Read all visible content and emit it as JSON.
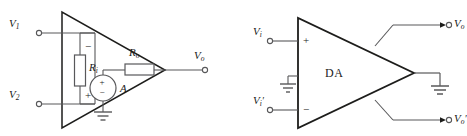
{
  "figure": {
    "stroke_color": "#58585a",
    "bold_stroke_color": "#1d1d1b",
    "text_color": "#1a1a1a",
    "background": "#ffffff"
  },
  "left_circuit": {
    "name": "op-amp-equivalent-model",
    "input1": {
      "label_v": "V",
      "label_sub": "1"
    },
    "input2": {
      "label_v": "V",
      "label_sub": "2"
    },
    "input_resistor": {
      "label_v": "R",
      "label_sub": "i"
    },
    "output_resistor": {
      "label_v": "R",
      "label_sub": "o"
    },
    "source_gain": "A",
    "source_plus": "+",
    "source_minus": "−",
    "ri_minus": "−",
    "ri_plus": "+",
    "output": {
      "label_v": "V",
      "label_sub": "o"
    },
    "ground": "ground-symbol"
  },
  "right_circuit": {
    "name": "differential-amplifier-block",
    "block_label": "DA",
    "input_top": {
      "label_v": "V",
      "label_sub": "i",
      "prime": ""
    },
    "input_bottom": {
      "label_v": "V",
      "label_sub": "i",
      "prime": "′"
    },
    "terminal_plus": "+",
    "terminal_minus": "−",
    "output_top": {
      "label_v": "V",
      "label_sub": "o",
      "prime": ""
    },
    "output_bottom": {
      "label_v": "V",
      "label_sub": "o",
      "prime": "′"
    },
    "ground_input": "ground-symbol",
    "ground_output": "ground-symbol"
  }
}
